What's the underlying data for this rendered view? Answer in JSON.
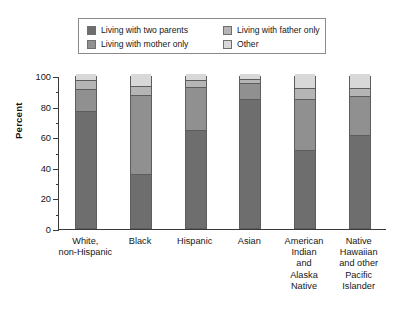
{
  "chart_data": {
    "type": "bar",
    "stacked": true,
    "title": "",
    "xlabel": "",
    "ylabel": "Percent",
    "ylim": [
      0,
      100
    ],
    "ytick_labels": [
      "0",
      "20",
      "40",
      "60",
      "80",
      "100"
    ],
    "ytick_values": [
      0,
      20,
      40,
      60,
      80,
      100
    ],
    "ytick_step": 20,
    "minor_ticks": true,
    "grid": false,
    "legend_position": "top",
    "categories": [
      "White,\nnon-Hispanic",
      "Black",
      "Hispanic",
      "Asian",
      "American\nIndian\nand\nAlaska\nNative",
      "Native\nHawaiian\nand other\nPacific\nIslander"
    ],
    "category_lines": [
      [
        "White,",
        "non-Hispanic"
      ],
      [
        "Black"
      ],
      [
        "Hispanic"
      ],
      [
        "Asian"
      ],
      [
        "American",
        "Indian",
        "and",
        "Alaska",
        "Native"
      ],
      [
        "Native",
        "Hawaiian",
        "and other",
        "Pacific",
        "Islander"
      ]
    ],
    "series": [
      {
        "name": "Living with two parents",
        "color": "#6e6e6e",
        "values": [
          77,
          35,
          64,
          85,
          51,
          61
        ]
      },
      {
        "name": "Living with mother only",
        "color": "#909090",
        "values": [
          14,
          52,
          28,
          10,
          33,
          25
        ]
      },
      {
        "name": "Living with father only",
        "color": "#b5b5b5",
        "values": [
          5,
          5,
          4,
          2,
          7,
          5
        ]
      },
      {
        "name": "Other",
        "color": "#d8d8d8",
        "values": [
          4,
          8,
          4,
          3,
          9,
          9
        ]
      }
    ]
  },
  "legend": {
    "items": [
      {
        "label": "Living with two parents",
        "color": "#6e6e6e"
      },
      {
        "label": "Living with father only",
        "color": "#b5b5b5"
      },
      {
        "label": "Living with mother only",
        "color": "#909090"
      },
      {
        "label": "Other",
        "color": "#d8d8d8"
      }
    ]
  }
}
